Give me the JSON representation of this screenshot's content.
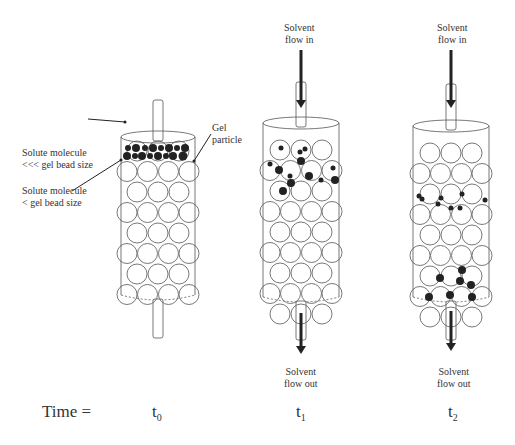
{
  "labels": {
    "solute_large": [
      "Solute molecule",
      "<<< gel bead size"
    ],
    "solute_small": [
      "Solute molecule",
      "< gel bead size"
    ],
    "gel_particle": [
      "Gel",
      "particle"
    ],
    "flow_in_1": [
      "Solvent",
      "flow in"
    ],
    "flow_in_2": [
      "Solvent",
      "flow in"
    ],
    "flow_out_1": [
      "Solvent",
      "flow out"
    ],
    "flow_out_2": [
      "Solvent",
      "flow out"
    ]
  },
  "time": {
    "label": "Time =",
    "t0": "t",
    "t0_sub": "0",
    "t1": "t",
    "t1_sub": "1",
    "t2": "t",
    "t2_sub": "2"
  }
}
